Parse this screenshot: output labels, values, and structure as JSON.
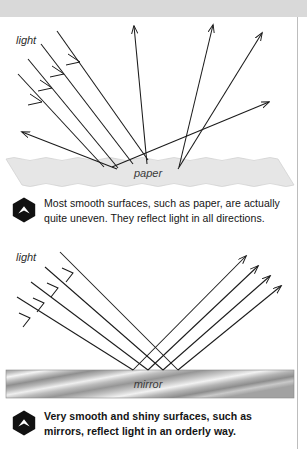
{
  "page": {
    "background": "#ffffff",
    "top_band_color": "#d9d9d9",
    "rule_color": "#bdbdbd"
  },
  "figures": [
    {
      "id": "paper",
      "kind": "diffuse-reflection-diagram",
      "light_label": "light",
      "surface_label": "paper",
      "surface_color": "#e4e4e4",
      "ray_color": "#1a1a1a",
      "incoming_rays": 4,
      "outgoing_rays": 5,
      "description": "Parallel light rays strike an uneven paper surface and scatter in many different directions."
    },
    {
      "id": "mirror",
      "kind": "specular-reflection-diagram",
      "light_label": "light",
      "surface_label": "mirror",
      "surface_color": "#b0b0b0",
      "ray_color": "#1a1a1a",
      "incoming_rays": 4,
      "outgoing_rays": 4,
      "description": "Parallel light rays strike a smooth mirror surface and reflect as a parallel bundle at the equal and opposite angle."
    }
  ],
  "captions": [
    {
      "id": "paper",
      "icon": "hexagon-up-arrow-icon",
      "lines": [
        "Most smooth surfaces, such as paper, are actually",
        "quite uneven. They reflect light in all directions."
      ],
      "bold": false
    },
    {
      "id": "mirror",
      "icon": "hexagon-up-arrow-icon",
      "lines": [
        "Very smooth and shiny surfaces, such as",
        "mirrors, reflect light in an orderly way."
      ],
      "bold": true
    }
  ]
}
